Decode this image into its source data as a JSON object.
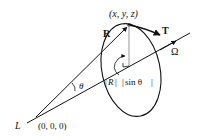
{
  "diagram": {
    "labels": {
      "point": "(x, y, z)",
      "R": "R",
      "T": "T",
      "omega": "Ω",
      "theta": "θ",
      "radius_R": "R",
      "radius_sin": "sin θ",
      "origin_letter": "L",
      "origin_coords": "(0, 0, 0)"
    },
    "colors": {
      "stroke": "#111111",
      "perpendicular": "#999999",
      "background": "#ffffff"
    }
  }
}
